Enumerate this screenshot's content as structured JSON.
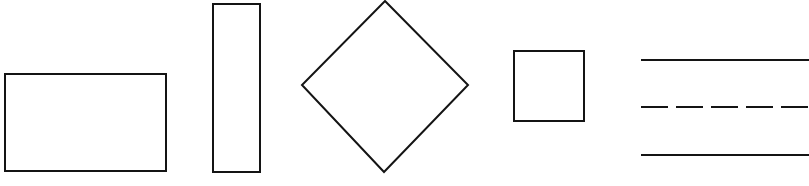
{
  "diagram": {
    "background": "#ffffff",
    "stroke_color": "#141414",
    "stroke_width": 2,
    "shapes": [
      {
        "id": "wide-rectangle",
        "type": "rect",
        "x": 5,
        "y": 74,
        "width": 161,
        "height": 97
      },
      {
        "id": "tall-rectangle",
        "type": "rect",
        "x": 213,
        "y": 4,
        "width": 47,
        "height": 168
      },
      {
        "id": "diamond",
        "type": "polygon",
        "points": "385,1 468,85 384,172 302,85"
      },
      {
        "id": "square",
        "type": "rect",
        "x": 514,
        "y": 51,
        "width": 70,
        "height": 70
      }
    ],
    "lines": [
      {
        "id": "solid-line-top",
        "style": "solid",
        "x1": 641,
        "y1": 60,
        "x2": 809,
        "y2": 60
      },
      {
        "id": "dashed-line-middle",
        "style": "dashed",
        "dash": "27 8",
        "x1": 641,
        "y1": 107,
        "x2": 809,
        "y2": 107
      },
      {
        "id": "solid-line-bottom",
        "style": "solid",
        "x1": 641,
        "y1": 155,
        "x2": 809,
        "y2": 155
      }
    ]
  }
}
